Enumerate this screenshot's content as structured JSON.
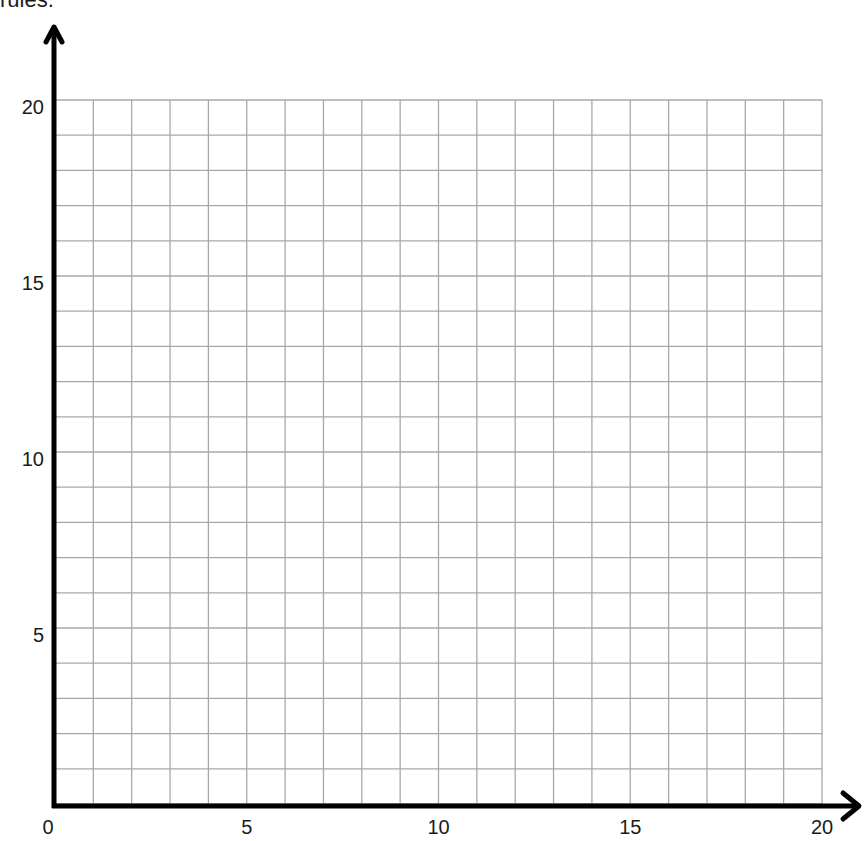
{
  "page": {
    "top_text_fragment": "rules."
  },
  "chart_data": {
    "type": "scatter",
    "title": "",
    "xlabel": "",
    "ylabel": "",
    "xlim": [
      0,
      20
    ],
    "ylim": [
      0,
      20
    ],
    "grid": true,
    "grid_step": 1,
    "x_ticks": [
      0,
      5,
      10,
      15,
      20
    ],
    "y_ticks": [
      5,
      10,
      15,
      20
    ],
    "x_tick_labels": [
      "0",
      "5",
      "10",
      "15",
      "20"
    ],
    "y_tick_labels": [
      "5",
      "10",
      "15",
      "20"
    ],
    "series": [],
    "axes_arrows": {
      "x": true,
      "y": true
    },
    "note": "Blank coordinate grid, no data plotted"
  },
  "colors": {
    "axis": "#000000",
    "grid": "#a8a8a8",
    "background": "#ffffff",
    "text": "#1a1a1a"
  }
}
